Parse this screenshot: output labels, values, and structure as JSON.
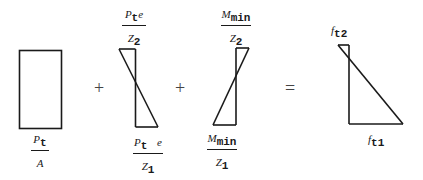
{
  "diagram": {
    "title": "",
    "operators": {
      "plus1": "+",
      "plus2": "+",
      "equals": "="
    },
    "stress_blocks": [
      {
        "name": "axial-prestress",
        "shape": "rectangle",
        "bottom_label": {
          "num_base": "P",
          "num_sub": "t",
          "num_suffix": "",
          "den_base": "A",
          "den_sub": ""
        }
      },
      {
        "name": "eccentric-prestress",
        "shape": "bowtie",
        "top_label": {
          "num_base": "P",
          "num_sub": "t",
          "num_suffix": "e",
          "den_base": "Z",
          "den_sub": "2"
        },
        "bottom_label": {
          "num_base": "P",
          "num_sub": "t",
          "num_suffix": "e",
          "den_base": "Z",
          "den_sub": "1"
        }
      },
      {
        "name": "minimum-moment",
        "shape": "bowtie",
        "top_label": {
          "num_base": "M",
          "num_sub": "min",
          "num_suffix": "",
          "den_base": "Z",
          "den_sub": "2"
        },
        "bottom_label": {
          "num_base": "M",
          "num_sub": "min",
          "num_suffix": "",
          "den_base": "Z",
          "den_sub": "1"
        }
      },
      {
        "name": "resultant-stress",
        "shape": "triangle",
        "top_label": {
          "base": "f",
          "sub": "t2"
        },
        "bottom_label": {
          "base": "f",
          "sub": "t1"
        }
      }
    ],
    "colors": {
      "stroke": "#1a1a1a",
      "background": "#ffffff",
      "operator": "#444444"
    }
  }
}
